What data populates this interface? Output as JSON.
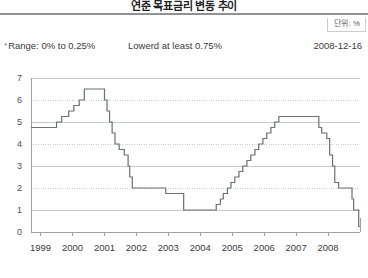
{
  "header": {
    "title": "연준 목표금리 변동 추이",
    "unit_label": "단위: %"
  },
  "info": {
    "bullet": "*",
    "range_text": "Range: 0% to 0.25%",
    "middle_text": "Lowerd at least 0.75%",
    "date_text": "2008-12-16"
  },
  "colors": {
    "line": "#6b6f76",
    "grid": "#c8cbcf",
    "axis": "#9aa0a6",
    "title_rule": "#8e9196",
    "text": "#3a3a3a"
  },
  "chart_data": {
    "type": "line",
    "title": "연준 목표금리 변동 추이",
    "xlabel": "",
    "ylabel": "",
    "unit": "%",
    "grid": true,
    "legend": "none",
    "step": "post",
    "xlim": [
      1998.7,
      2009.0
    ],
    "ylim": [
      0,
      7
    ],
    "yticks": [
      0,
      1,
      2,
      3,
      4,
      5,
      6,
      7
    ],
    "ytick_labels": [
      "0",
      "1",
      "2",
      "3",
      "4",
      "5",
      "6",
      "7"
    ],
    "xticks": [
      1999,
      2000,
      2001,
      2002,
      2003,
      2004,
      2005,
      2006,
      2007,
      2008
    ],
    "xtick_labels": [
      "1999",
      "2000",
      "2001",
      "2002",
      "2003",
      "2004",
      "2005",
      "2006",
      "2007",
      "2008"
    ],
    "series": [
      {
        "name": "Fed target rate",
        "x": [
          1998.7,
          1999.5,
          1999.66,
          1999.88,
          2000.04,
          2000.21,
          2000.37,
          2001.0,
          2001.08,
          2001.16,
          2001.24,
          2001.33,
          2001.46,
          2001.62,
          2001.74,
          2001.79,
          2001.87,
          2002.92,
          2003.48,
          2004.5,
          2004.63,
          2004.72,
          2004.85,
          2004.96,
          2005.08,
          2005.21,
          2005.33,
          2005.46,
          2005.58,
          2005.71,
          2005.83,
          2005.96,
          2006.08,
          2006.21,
          2006.33,
          2006.46,
          2007.71,
          2007.8,
          2007.96,
          2008.05,
          2008.14,
          2008.21,
          2008.33,
          2008.75,
          2008.8,
          2008.96,
          2009.0
        ],
        "y": [
          4.75,
          5.0,
          5.25,
          5.5,
          5.75,
          6.0,
          6.5,
          6.0,
          5.5,
          5.0,
          4.5,
          4.0,
          3.75,
          3.5,
          3.0,
          2.5,
          2.0,
          1.75,
          1.0,
          1.25,
          1.5,
          1.75,
          2.0,
          2.25,
          2.5,
          2.75,
          3.0,
          3.25,
          3.5,
          3.75,
          4.0,
          4.25,
          4.5,
          4.75,
          5.0,
          5.25,
          4.75,
          4.5,
          4.25,
          3.5,
          3.0,
          2.25,
          2.0,
          1.5,
          1.0,
          0.25,
          0.25
        ]
      }
    ],
    "annotations": [
      "Range: 0% to 0.25%",
      "Lowerd at least 0.75%",
      "2008-12-16"
    ]
  }
}
